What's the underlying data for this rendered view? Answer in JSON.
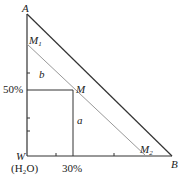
{
  "diagram": {
    "points": {
      "A": {
        "label": "A",
        "x": 27,
        "y": 14
      },
      "W": {
        "label": "W",
        "sub": "(H₂O)",
        "x": 27,
        "y": 156
      },
      "B": {
        "label": "B",
        "x": 172,
        "y": 156
      },
      "M": {
        "label": "M",
        "x": 73,
        "y": 90
      },
      "M1": {
        "label": "M",
        "sub": "1",
        "x": 27,
        "y": 44
      },
      "M2": {
        "label": "M",
        "sub": "2",
        "x": 146,
        "y": 156
      }
    },
    "segment_labels": {
      "a": "a",
      "b": "b"
    },
    "axis_labels": {
      "y_tick": "50%",
      "x_tick": "30%"
    },
    "colors": {
      "line": "#333333",
      "light_line": "#999999"
    }
  }
}
